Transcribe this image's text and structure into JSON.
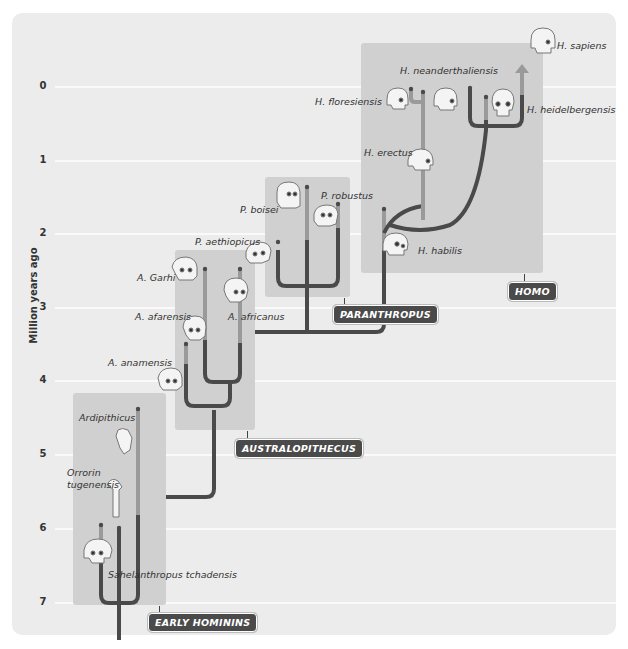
{
  "axis": {
    "label": "Million years ago",
    "ticks": [
      "0",
      "1",
      "2",
      "3",
      "4",
      "5",
      "6",
      "7"
    ]
  },
  "groups": {
    "early": "EARLY HOMININS",
    "australopithecus": "AUSTRALOPITHECUS",
    "paranthropus": "PARANTHROPUS",
    "homo": "HOMO"
  },
  "species": {
    "h_sapiens": "H. sapiens",
    "h_neanderthalensis": "H. neanderthaliensis",
    "h_floresiensis": "H. floresiensis",
    "h_heidelbergensis": "H. heidelbergensis",
    "h_erectus": "H. erectus",
    "h_habilis": "H. habilis",
    "p_boisei": "P. boisei",
    "p_robustus": "P. robustus",
    "p_aethiopicus": "P. aethiopicus",
    "a_garhi": "A. Garhi",
    "a_afarensis": "A. afarensis",
    "a_africanus": "A. africanus",
    "a_anamensis": "A. anamensis",
    "ardipithicus": "Ardipithicus",
    "orrorin_1": "Orrorin",
    "orrorin_2": "tugenensis",
    "sahelanthropus": "Sahelanthropus tchadensis"
  },
  "colors": {
    "panel": "#ececec",
    "group_box": "#d0d0d0",
    "branch_dark": "#4a4a4a",
    "branch_light": "#9a9a9a",
    "badge": "#4a4a4a",
    "grid": "#fafafa"
  }
}
